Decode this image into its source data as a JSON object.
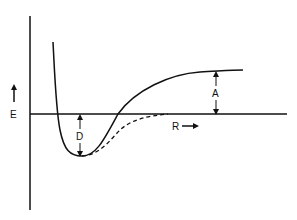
{
  "diagram": {
    "type": "potential-energy-curve",
    "labels": {
      "energy_axis": "E",
      "distance_axis": "R",
      "well_depth": "D",
      "asymptote_gap": "A"
    },
    "curves": [
      {
        "name": "solid-potential-curve",
        "style": "solid"
      },
      {
        "name": "dashed-potential-curve",
        "style": "dashed"
      }
    ],
    "colors": {
      "ink": "#111111",
      "background": "#ffffff"
    }
  }
}
